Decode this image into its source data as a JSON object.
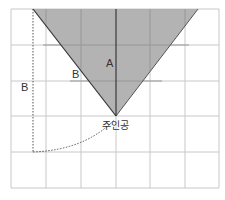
{
  "diagram": {
    "grid": {
      "x_lines": [
        11,
        46,
        81,
        116,
        150,
        185,
        219
      ],
      "y_lines": [
        9,
        45,
        81,
        116,
        152,
        188
      ],
      "line_color": "#c8c8c8"
    },
    "triangle": {
      "fill": "#ababab",
      "edge_color": "#333333",
      "points": "33,9 198,9 116,116"
    },
    "labels": {
      "a": "A",
      "b_edge": "B",
      "b_side": "B",
      "protagonist": "주인공"
    }
  }
}
